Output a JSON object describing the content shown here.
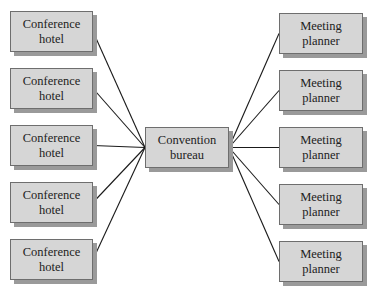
{
  "diagram": {
    "type": "hub-and-spoke",
    "hub": {
      "line1": "Convention",
      "line2": "bureau",
      "x": 145,
      "y": 127,
      "w": 84,
      "h": 41
    },
    "left_nodes": [
      {
        "line1": "Conference",
        "line2": "hotel",
        "x": 10,
        "y": 11,
        "w": 83,
        "h": 41
      },
      {
        "line1": "Conference",
        "line2": "hotel",
        "x": 10,
        "y": 68,
        "w": 83,
        "h": 41
      },
      {
        "line1": "Conference",
        "line2": "hotel",
        "x": 10,
        "y": 125,
        "w": 83,
        "h": 41
      },
      {
        "line1": "Conference",
        "line2": "hotel",
        "x": 10,
        "y": 182,
        "w": 83,
        "h": 41
      },
      {
        "line1": "Conference",
        "line2": "hotel",
        "x": 10,
        "y": 239,
        "w": 83,
        "h": 41
      }
    ],
    "right_nodes": [
      {
        "line1": "Meeting",
        "line2": "planner",
        "x": 279,
        "y": 13,
        "w": 84,
        "h": 41
      },
      {
        "line1": "Meeting",
        "line2": "planner",
        "x": 279,
        "y": 70,
        "w": 84,
        "h": 41
      },
      {
        "line1": "Meeting",
        "line2": "planner",
        "x": 279,
        "y": 127,
        "w": 84,
        "h": 41
      },
      {
        "line1": "Meeting",
        "line2": "planner",
        "x": 279,
        "y": 184,
        "w": 84,
        "h": 41
      },
      {
        "line1": "Meeting",
        "line2": "planner",
        "x": 279,
        "y": 241,
        "w": 84,
        "h": 41
      }
    ],
    "colors": {
      "box_fill": "#d6d6d6",
      "box_border": "#6e6e6e",
      "shadow": "#9a9a9a",
      "line": "#1a1a1a"
    }
  }
}
